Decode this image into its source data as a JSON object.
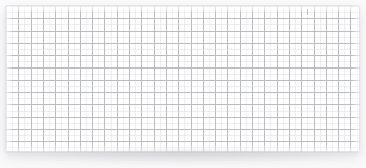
{
  "panel": {
    "name": "grid-sheet",
    "title": "",
    "description": "Blank white grid sheet panel",
    "background_color": "#fafafb",
    "sheet_color": "#ffffff",
    "major_grid_color": "#babac4",
    "minor_grid_color": "#d6d6de",
    "border_color": "#cdcdd4",
    "shadow_color": "#8c8c98"
  },
  "geometry": {
    "canvas_width": 366,
    "canvas_height": 168,
    "sheet_left": 5,
    "sheet_top": 5,
    "sheet_width": 355,
    "sheet_height": 147,
    "corner_radius": 3,
    "major_cell_px": 12.3,
    "minor_cell_px": 6.15,
    "major_columns": 29,
    "major_rows": 12
  },
  "markers": {
    "top_tick_label": "",
    "top_tick_x": 302,
    "top_tick_y": 4
  },
  "content": {
    "text": "",
    "empty_state_label": ""
  }
}
